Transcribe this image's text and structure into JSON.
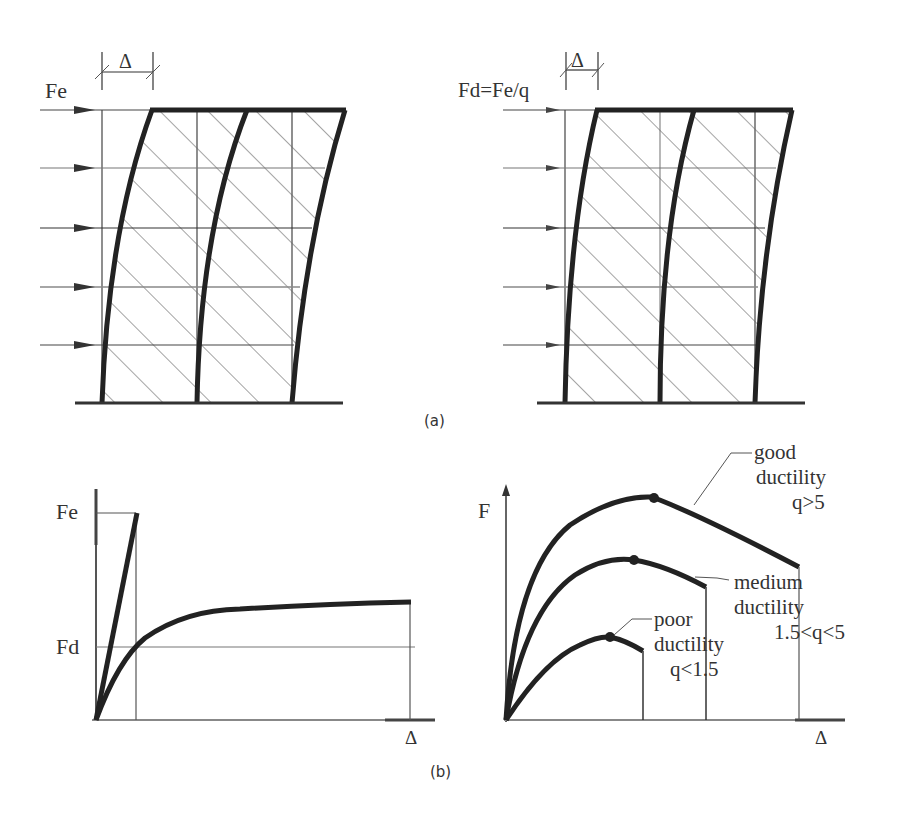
{
  "figure": {
    "panel_a": {
      "caption": "(a)",
      "left_frame": {
        "force_label": "Fe",
        "drift_label": "Δ",
        "floors": 5,
        "bays": 2
      },
      "right_frame": {
        "force_label": "Fd=Fe/q",
        "drift_label": "Δ",
        "floors": 5,
        "bays": 2
      }
    },
    "panel_b": {
      "caption": "(b)",
      "left_chart": {
        "y_labels": [
          "Fe",
          "Fd"
        ],
        "x_label": "Δ",
        "curves": [
          "elastic response (linear to Fe)",
          "inelastic response (nonlinear plateau above Fd)"
        ]
      },
      "right_chart": {
        "y_label": "F",
        "x_label": "Δ",
        "annotations": {
          "good": {
            "line1": "good",
            "line2": "ductility",
            "line3": "q>5"
          },
          "medium": {
            "line1": "medium",
            "line2": "ductility",
            "line3": "1.5<q<5"
          },
          "poor": {
            "line1": "poor",
            "line2": "ductility",
            "line3": "q<1.5"
          }
        }
      }
    }
  },
  "colors": {
    "ink": "#222222",
    "thin": "#555555",
    "hatch": "#666666",
    "background": "#ffffff"
  }
}
